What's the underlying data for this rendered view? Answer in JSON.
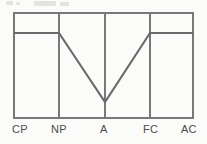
{
  "figure": {
    "name": "egogram",
    "background_color": "#fbfbf9",
    "line_color": "#6a6a6a",
    "frame_color": "#787878",
    "label_color": "#4b4b4b"
  },
  "chart_data": {
    "type": "bar",
    "title": "",
    "subtitle": "",
    "xlabel": "",
    "ylabel": "",
    "categories": [
      "CP",
      "NP",
      "A",
      "FC",
      "AC"
    ],
    "values": [
      72,
      72,
      15,
      72,
      72
    ],
    "ylim": [
      0,
      100
    ],
    "grid": false,
    "legend": null,
    "annotations": [],
    "tick_labels": {
      "x": [
        "CP",
        "NP",
        "A",
        "FC",
        "AC"
      ],
      "y": []
    }
  },
  "geometry": {
    "frame": {
      "left": 14,
      "right": 193,
      "top": 13,
      "bottom": 118
    },
    "dividers_x": [
      59,
      105,
      150
    ],
    "category_centers_x": [
      36,
      82,
      127,
      171
    ],
    "plateau_y": 33,
    "valley_y": 102,
    "valley_x": 105
  },
  "labels": [
    {
      "text": "CP",
      "x": 12,
      "y": 123
    },
    {
      "text": "NP",
      "x": 51,
      "y": 123
    },
    {
      "text": "A",
      "x": 100,
      "y": 123
    },
    {
      "text": "FC",
      "x": 143,
      "y": 123
    },
    {
      "text": "AC",
      "x": 181,
      "y": 123
    }
  ]
}
